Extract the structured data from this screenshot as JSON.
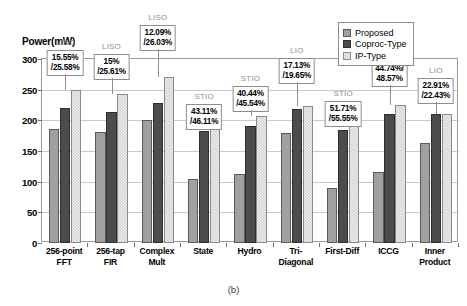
{
  "figure": {
    "caption": "(b)",
    "y_axis_title": "Power(mW)"
  },
  "legend": {
    "position": "top-right",
    "items": [
      {
        "label": "Proposed",
        "key": "proposed",
        "color": "#a0a0a0"
      },
      {
        "label": "Coproc-Type",
        "key": "coproc",
        "color": "#4c4c4c"
      },
      {
        "label": "IP-Type",
        "key": "ip",
        "color": "#cfcfcf"
      }
    ]
  },
  "chart_data": {
    "type": "bar",
    "title": "",
    "xlabel": "",
    "ylabel": "Power(mW)",
    "ylim": [
      0,
      300
    ],
    "yticks": [
      0,
      50,
      100,
      150,
      200,
      250,
      300
    ],
    "grid": true,
    "categories": [
      "256-point FFT",
      "256-tap FIR",
      "Complex Mult",
      "State",
      "Hydro",
      "Tri-Diagonal",
      "First-Diff",
      "ICCG",
      "Inner Product"
    ],
    "category_lines": [
      [
        "256-point",
        "FFT"
      ],
      [
        "256-tap",
        "FIR"
      ],
      [
        "Complex",
        "Mult"
      ],
      [
        "State",
        ""
      ],
      [
        "Hydro",
        ""
      ],
      [
        "Tri-",
        "Diagonal"
      ],
      [
        "First-Diff",
        ""
      ],
      [
        "ICCG",
        ""
      ],
      [
        "Inner",
        "Product"
      ]
    ],
    "series": [
      {
        "name": "Proposed",
        "values": [
          186,
          181,
          200,
          104,
          113,
          180,
          89,
          116,
          163
        ]
      },
      {
        "name": "Coproc-Type",
        "values": [
          220,
          213,
          228,
          183,
          190,
          218,
          184,
          211,
          211
        ]
      },
      {
        "name": "IP-Type",
        "values": [
          250,
          243,
          270,
          191,
          207,
          224,
          199,
          225,
          210
        ]
      }
    ],
    "group_type_tags": [
      "LISO",
      "LISO",
      "LISO",
      "STIO",
      "STIO",
      "LIO",
      "STIO",
      "STIO",
      "LIO"
    ],
    "annotations": [
      {
        "group": "256-point FFT",
        "line1": "15.55%",
        "line2": "/25.58%"
      },
      {
        "group": "256-tap FIR",
        "line1": "15%",
        "line2": "/25.61%"
      },
      {
        "group": "Complex Mult",
        "line1": "12.09%",
        "line2": "/26.03%"
      },
      {
        "group": "State",
        "line1": "43.11%",
        "line2": "/46.11%"
      },
      {
        "group": "Hydro",
        "line1": "40.44%",
        "line2": "/45.54%"
      },
      {
        "group": "Tri-Diagonal",
        "line1": "17.13%",
        "line2": "/19.65%"
      },
      {
        "group": "First-Diff",
        "line1": "51.71%",
        "line2": "/55.55%"
      },
      {
        "group": "ICCG",
        "line1": "44.74%/",
        "line2": "48.57%"
      },
      {
        "group": "Inner Product",
        "line1": "22.91%",
        "line2": "/22.43%"
      }
    ]
  }
}
